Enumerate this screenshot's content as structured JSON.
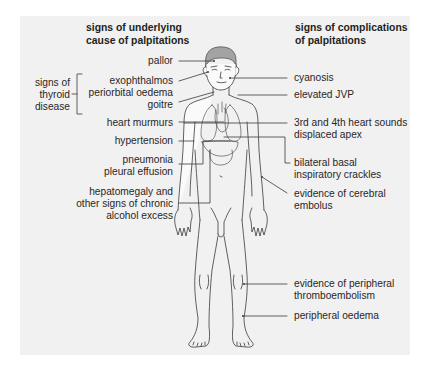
{
  "headers": {
    "left": [
      "signs of underlying",
      "cause of palpitations"
    ],
    "right": [
      "signs of complications",
      "of palpitations"
    ]
  },
  "left_labels": {
    "pallor": [
      "pallor"
    ],
    "eyes": [
      "exophthalmos",
      "periorbital oedema"
    ],
    "goitre": [
      "goitre"
    ],
    "heart_murmurs": [
      "heart murmurs"
    ],
    "hypertension": [
      "hypertension"
    ],
    "pneumonia": [
      "pneumonia",
      "pleural effusion"
    ],
    "hepatomegaly": [
      "hepatomegaly and",
      "other signs of chronic",
      "alcohol excess"
    ]
  },
  "group": {
    "thyroid": [
      "signs of",
      "thyroid",
      "disease"
    ]
  },
  "right_labels": {
    "cyanosis": [
      "cyanosis"
    ],
    "jvp": [
      "elevated JVP"
    ],
    "heart_sounds": [
      "3rd and 4th heart sounds",
      "displaced apex"
    ],
    "crackles": [
      "bilateral  basal",
      "inspiratory crackles"
    ],
    "cerebral": [
      "evidence of cerebral",
      "embolus"
    ],
    "thrombo": [
      "evidence of peripheral",
      "thromboembolism"
    ],
    "oedema": [
      "peripheral oedema"
    ]
  },
  "colors": {
    "panel_bg": "#f1f1f1",
    "line": "#3a3a3a",
    "hair": "#a3a3a3",
    "text": "#231f20"
  }
}
